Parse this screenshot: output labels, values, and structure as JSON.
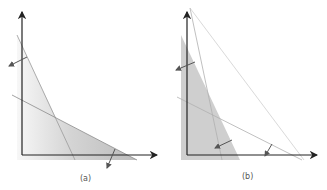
{
  "figure": {
    "panels": [
      {
        "id": "a",
        "caption": "(a)",
        "description": "Feasible region bounded by two constraint lines, both with arrows pointing outward"
      },
      {
        "id": "b",
        "caption": "(b)",
        "description": "Feasible region with shifted constraint lines and inward/outward arrows"
      }
    ],
    "colors": {
      "axis": "#222222",
      "region": "#c8c8c8",
      "region_light": "#ececec",
      "line": "#888888",
      "thin_line": "#aaaaaa",
      "arrow": "#555555"
    }
  }
}
